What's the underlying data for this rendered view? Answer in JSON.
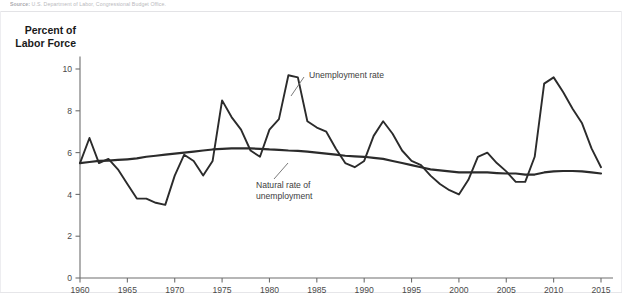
{
  "source_note": {
    "prefix": "Source:",
    "text": "U.S. Department of Labor, Congressional Budget Office."
  },
  "axis": {
    "y_title_line1": "Percent of",
    "y_title_line2": "Labor Force",
    "y_ticks": [
      0,
      2,
      4,
      6,
      8,
      10
    ],
    "x_ticks": [
      1960,
      1965,
      1970,
      1975,
      1980,
      1985,
      1990,
      1995,
      2000,
      2005,
      2010,
      2015
    ]
  },
  "annotations": {
    "unemployment_rate": "Unemployment rate",
    "natural_rate_line1": "Natural rate of",
    "natural_rate_line2": "unemployment"
  },
  "colors": {
    "line": "#2b2b2b",
    "axis": "#6e6e6e",
    "text": "#1a1a1a",
    "background": "#ffffff"
  },
  "chart_data": {
    "type": "line",
    "title": "",
    "xlabel": "",
    "ylabel": "Percent of Labor Force",
    "xlim": [
      1960,
      2015
    ],
    "ylim": [
      0,
      11
    ],
    "grid": false,
    "legend": "annotated-inline",
    "x": [
      1960,
      1961,
      1962,
      1963,
      1964,
      1965,
      1966,
      1967,
      1968,
      1969,
      1970,
      1971,
      1972,
      1973,
      1974,
      1975,
      1976,
      1977,
      1978,
      1979,
      1980,
      1981,
      1982,
      1983,
      1984,
      1985,
      1986,
      1987,
      1988,
      1989,
      1990,
      1991,
      1992,
      1993,
      1994,
      1995,
      1996,
      1997,
      1998,
      1999,
      2000,
      2001,
      2002,
      2003,
      2004,
      2005,
      2006,
      2007,
      2008,
      2009,
      2010,
      2011,
      2012,
      2013,
      2014,
      2015
    ],
    "series": [
      {
        "name": "Unemployment rate",
        "values": [
          5.5,
          6.7,
          5.5,
          5.7,
          5.2,
          4.5,
          3.8,
          3.8,
          3.6,
          3.5,
          4.9,
          5.9,
          5.6,
          4.9,
          5.6,
          8.5,
          7.7,
          7.1,
          6.1,
          5.8,
          7.1,
          7.6,
          9.7,
          9.6,
          7.5,
          7.2,
          7.0,
          6.2,
          5.5,
          5.3,
          5.6,
          6.8,
          7.5,
          6.9,
          6.1,
          5.6,
          5.4,
          4.9,
          4.5,
          4.2,
          4.0,
          4.7,
          5.8,
          6.0,
          5.5,
          5.1,
          4.6,
          4.6,
          5.8,
          9.3,
          9.6,
          8.9,
          8.1,
          7.4,
          6.2,
          5.3
        ]
      },
      {
        "name": "Natural rate of unemployment",
        "values": [
          5.5,
          5.55,
          5.6,
          5.62,
          5.65,
          5.68,
          5.72,
          5.8,
          5.85,
          5.9,
          5.95,
          6.0,
          6.05,
          6.1,
          6.15,
          6.18,
          6.2,
          6.2,
          6.2,
          6.18,
          6.15,
          6.13,
          6.1,
          6.08,
          6.05,
          6.0,
          5.95,
          5.9,
          5.85,
          5.82,
          5.8,
          5.75,
          5.7,
          5.6,
          5.5,
          5.4,
          5.3,
          5.2,
          5.15,
          5.1,
          5.05,
          5.05,
          5.05,
          5.05,
          5.02,
          5.0,
          5.0,
          4.95,
          4.95,
          5.05,
          5.1,
          5.12,
          5.12,
          5.1,
          5.05,
          5.0
        ]
      }
    ]
  }
}
